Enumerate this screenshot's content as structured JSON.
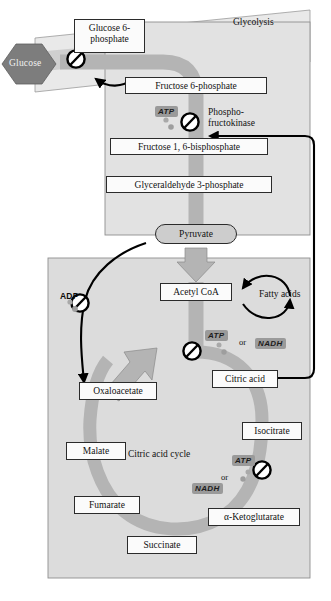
{
  "figure": {
    "title_visible": false,
    "compartments": {
      "glycolysis_label": "Glycolysis",
      "cycle_label": "Citric acid cycle"
    }
  },
  "colors": {
    "pathway_gray": "#b4b4b4",
    "compartment_fill": "#dcdcdc",
    "membrane_fill": "#e8e8e8",
    "glucose_hex_fill": "#7d7d7d",
    "box_fill": "#fbfbfb",
    "outline": "#2b2b2b",
    "chip_shade": "#9a9a9a",
    "arrow_black": "#000000"
  },
  "glycolysis": {
    "panel_label": "Glycolysis",
    "metabolites": [
      {
        "id": "glucose",
        "label": "Glucose",
        "shape": "hexagon"
      },
      {
        "id": "glucose-6-phosphate",
        "label": "Glucose 6-\nphosphate",
        "line1": "Glucose 6-",
        "line2": "phosphate"
      },
      {
        "id": "fructose-6-phosphate",
        "label": "Fructose 6-phosphate"
      },
      {
        "id": "fructose-1-6-bisphosphate",
        "label": "Fructose 1, 6-bisphosphate"
      },
      {
        "id": "glyceraldehyde-3-phosphate",
        "label": "Glyceraldehyde 3-phosphate"
      },
      {
        "id": "pyruvate",
        "label": "Pyruvate",
        "shape": "rounded"
      }
    ],
    "enzyme": {
      "id": "phosphofructokinase",
      "line1": "Phospho-",
      "line2": "fructokinase"
    },
    "regulators": [
      {
        "id": "atp-glycolysis",
        "label": "ATP",
        "style": "shaded"
      }
    ],
    "inhibition_points": [
      {
        "id": "inhibit-glucose-transport",
        "target": "glucose-uptake"
      },
      {
        "id": "inhibit-phosphofructokinase",
        "target": "phosphofructokinase"
      }
    ]
  },
  "mitochondrion": {
    "metabolites": [
      {
        "id": "acetyl-coa",
        "label": "Acetyl CoA"
      },
      {
        "id": "citric-acid",
        "label": "Citric acid"
      },
      {
        "id": "isocitrate",
        "label": "Isocitrate"
      },
      {
        "id": "alpha-ketoglutarate",
        "label": "α-Ketoglutarate"
      },
      {
        "id": "succinate",
        "label": "Succinate"
      },
      {
        "id": "fumarate",
        "label": "Fumarate"
      },
      {
        "id": "malate",
        "label": "Malate"
      },
      {
        "id": "oxaloacetate",
        "label": "Oxaloacetate"
      }
    ],
    "cycle_label": "Citric acid cycle",
    "products": [
      {
        "id": "fatty-acids",
        "label": "Fatty acids"
      }
    ],
    "regulators": [
      {
        "id": "adp-regulator",
        "label": "ADP",
        "style": "plain"
      },
      {
        "id": "atp-acetylcoa",
        "label": "ATP",
        "style": "shaded"
      },
      {
        "id": "nadh-acetylcoa",
        "label": "NADH",
        "style": "shaded"
      },
      {
        "id": "atp-cycle",
        "label": "ATP",
        "style": "shaded"
      },
      {
        "id": "nadh-cycle",
        "label": "NADH",
        "style": "shaded"
      },
      {
        "id": "or-acetylcoa",
        "label": "or"
      },
      {
        "id": "or-cycle",
        "label": "or"
      }
    ],
    "inhibition_points": [
      {
        "id": "inhibit-adp-path",
        "target": "oxaloacetate-branch"
      },
      {
        "id": "inhibit-acetylcoa-to-citrate",
        "target": "citrate-synthase-step"
      },
      {
        "id": "inhibit-isocitrate-step",
        "target": "isocitrate-dehydrogenase-step"
      }
    ]
  }
}
